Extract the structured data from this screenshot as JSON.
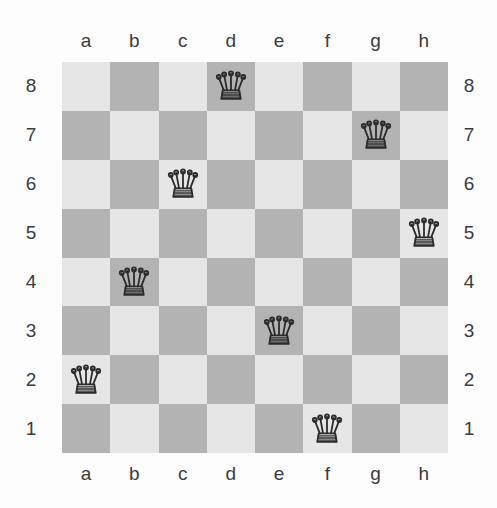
{
  "board": {
    "files": [
      "a",
      "b",
      "c",
      "d",
      "e",
      "f",
      "g",
      "h"
    ],
    "ranks": [
      "8",
      "7",
      "6",
      "5",
      "4",
      "3",
      "2",
      "1"
    ],
    "light_square_color": "#e6e6e6",
    "dark_square_color": "#b3b3b3",
    "label_color": "#3c3c3c",
    "background_color": "#fdfdfd",
    "piece_color": "#2b2b2b",
    "size": 8,
    "squares": [
      [
        "light",
        "dark",
        "light",
        "dark",
        "light",
        "dark",
        "light",
        "dark"
      ],
      [
        "dark",
        "light",
        "dark",
        "light",
        "dark",
        "light",
        "dark",
        "light"
      ],
      [
        "light",
        "dark",
        "light",
        "dark",
        "light",
        "dark",
        "light",
        "dark"
      ],
      [
        "dark",
        "light",
        "dark",
        "light",
        "dark",
        "light",
        "dark",
        "light"
      ],
      [
        "light",
        "dark",
        "light",
        "dark",
        "light",
        "dark",
        "light",
        "dark"
      ],
      [
        "dark",
        "light",
        "dark",
        "light",
        "dark",
        "light",
        "dark",
        "light"
      ],
      [
        "light",
        "dark",
        "light",
        "dark",
        "light",
        "dark",
        "light",
        "dark"
      ],
      [
        "dark",
        "light",
        "dark",
        "light",
        "dark",
        "light",
        "dark",
        "light"
      ]
    ],
    "pieces": [
      {
        "square": "d8",
        "file": "d",
        "rank": "8",
        "type": "queen",
        "icon": "queen-icon"
      },
      {
        "square": "g7",
        "file": "g",
        "rank": "7",
        "type": "queen",
        "icon": "queen-icon"
      },
      {
        "square": "c6",
        "file": "c",
        "rank": "6",
        "type": "queen",
        "icon": "queen-icon"
      },
      {
        "square": "h5",
        "file": "h",
        "rank": "5",
        "type": "queen",
        "icon": "queen-icon"
      },
      {
        "square": "b4",
        "file": "b",
        "rank": "4",
        "type": "queen",
        "icon": "queen-icon"
      },
      {
        "square": "e3",
        "file": "e",
        "rank": "3",
        "type": "queen",
        "icon": "queen-icon"
      },
      {
        "square": "a2",
        "file": "a",
        "rank": "2",
        "type": "queen",
        "icon": "queen-icon"
      },
      {
        "square": "f1",
        "file": "f",
        "rank": "1",
        "type": "queen",
        "icon": "queen-icon"
      }
    ],
    "occupancy": [
      [
        "",
        "",
        "",
        "queen",
        "",
        "",
        "",
        ""
      ],
      [
        "",
        "",
        "",
        "",
        "",
        "",
        "queen",
        ""
      ],
      [
        "",
        "",
        "queen",
        "",
        "",
        "",
        "",
        ""
      ],
      [
        "",
        "",
        "",
        "",
        "",
        "",
        "",
        "queen"
      ],
      [
        "",
        "queen",
        "",
        "",
        "",
        "",
        "",
        ""
      ],
      [
        "",
        "",
        "",
        "",
        "queen",
        "",
        "",
        ""
      ],
      [
        "queen",
        "",
        "",
        "",
        "",
        "",
        "",
        ""
      ],
      [
        "",
        "",
        "",
        "",
        "",
        "queen",
        "",
        ""
      ]
    ]
  }
}
